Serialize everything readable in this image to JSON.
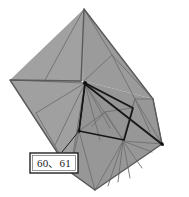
{
  "figure": {
    "kind": "origami folded model with crease lines",
    "canvas": {
      "width": 189,
      "height": 197
    },
    "colors": {
      "background": "#ffffff",
      "face_fill": "#9b9b9b",
      "face_fill_light": "#a4a4a4",
      "face_fill_dark": "#8e8e8e",
      "crease_line": "#6f6f6f",
      "silhouette_outline": "#5a5a5a",
      "highlight_line": "#171717",
      "callout_border": "#222222",
      "callout_fill": "#ffffff",
      "callout_text": "#1a1a1a"
    },
    "silhouette": {
      "name": "outer-boundary",
      "points": "84,9 153,99 162,144 95,190 70,172 10,80 81,81"
    },
    "faces": [
      {
        "name": "upper-left-wing-face",
        "points": "84,9 84,81 81,81 10,80",
        "fill": "#a1a1a1"
      },
      {
        "name": "upper-right-wing-face",
        "points": "84,9 153,99 84,81",
        "fill": "#9b9b9b"
      },
      {
        "name": "left-lower-wing-face",
        "points": "10,80 81,81 85,84 70,172",
        "fill": "#a0a0a0"
      },
      {
        "name": "body-core-face",
        "points": "84,81 153,99 162,144 95,190 70,172",
        "fill": "#979797"
      },
      {
        "name": "inner-pocket-face",
        "points": "85,84 132,108 123,140 79,131",
        "fill": "#949494"
      }
    ],
    "crease_lines": [
      {
        "name": "crease-upper-left-diagonal",
        "points": "84,9 45,80"
      },
      {
        "name": "crease-upper-right-a",
        "points": "84,9 112,55"
      },
      {
        "name": "crease-upper-right-b",
        "points": "112,55 84,81"
      },
      {
        "name": "crease-upper-right-c",
        "points": "112,55 153,99"
      },
      {
        "name": "crease-upper-right-d",
        "points": "112,55 135,99"
      },
      {
        "name": "crease-apex-to-left-tip",
        "points": "85,83 10,80"
      },
      {
        "name": "crease-left-wing-fan-1",
        "points": "85,83 36,113"
      },
      {
        "name": "crease-left-wing-fan-2",
        "points": "85,83 70,172"
      },
      {
        "name": "crease-left-wing-fan-3",
        "points": "85,83 55,145"
      },
      {
        "name": "crease-left-mid-chord",
        "points": "36,113 70,172"
      },
      {
        "name": "crease-apex-fan-a",
        "points": "85,84 132,108"
      },
      {
        "name": "crease-apex-fan-b",
        "points": "85,84 123,140"
      },
      {
        "name": "crease-apex-fan-c",
        "points": "85,84 110,128"
      },
      {
        "name": "crease-apex-fan-d",
        "points": "85,84 100,140"
      },
      {
        "name": "crease-right-node-fan-1",
        "points": "135,99 153,99"
      },
      {
        "name": "crease-right-node-fan-2",
        "points": "135,99 162,144"
      },
      {
        "name": "crease-right-node-fan-3",
        "points": "135,99 150,132"
      },
      {
        "name": "crease-right-node-fan-4",
        "points": "135,99 123,140"
      },
      {
        "name": "crease-right-node-fan-5",
        "points": "135,99 132,108"
      },
      {
        "name": "crease-right-edge-chord",
        "points": "153,99 162,144"
      },
      {
        "name": "crease-bottom-node-fan-1",
        "points": "123,141 95,190"
      },
      {
        "name": "crease-bottom-node-fan-2",
        "points": "123,141 108,186"
      },
      {
        "name": "crease-bottom-node-fan-3",
        "points": "123,141 118,182"
      },
      {
        "name": "crease-bottom-node-fan-4",
        "points": "123,141 130,178"
      },
      {
        "name": "crease-bottom-node-fan-5",
        "points": "123,141 142,168"
      },
      {
        "name": "crease-bottom-node-fan-6",
        "points": "123,141 152,152"
      },
      {
        "name": "crease-bottom-node-fan-7",
        "points": "123,141 162,144"
      },
      {
        "name": "crease-bottom-left-chord",
        "points": "70,172 95,190"
      },
      {
        "name": "crease-pocket-inner-1",
        "points": "105,112 132,108"
      },
      {
        "name": "crease-pocket-inner-2",
        "points": "105,112 123,140"
      },
      {
        "name": "crease-pocket-inner-3",
        "points": "105,112 92,126"
      },
      {
        "name": "crease-pocket-inner-4",
        "points": "105,112 79,131"
      },
      {
        "name": "crease-lower-left-fan-1",
        "points": "79,131 95,190"
      },
      {
        "name": "crease-lower-left-fan-2",
        "points": "79,131 70,172"
      }
    ],
    "highlight_lines": [
      {
        "name": "highlight-apex-to-right-node",
        "points": "85,83 133,108"
      },
      {
        "name": "highlight-right-node-down",
        "points": "133,108 124,140"
      },
      {
        "name": "highlight-pocket-bottom",
        "points": "124,140 79,131"
      },
      {
        "name": "highlight-pocket-left",
        "points": "79,131 85,84"
      },
      {
        "name": "highlight-leader-anchor-run",
        "points": "85,83 79,131"
      },
      {
        "name": "highlight-apex-to-bottom-right",
        "points": "85,84 163,145"
      }
    ],
    "marked_vertices": [
      {
        "name": "vertex-apex",
        "cx": 85,
        "cy": 83
      },
      {
        "name": "vertex-leader-anchor",
        "cx": 79,
        "cy": 131
      },
      {
        "name": "vertex-bottom-right",
        "cx": 162,
        "cy": 144
      }
    ],
    "leader": {
      "name": "callout-leader-line",
      "points": "79,131 62,152"
    },
    "callout": {
      "name": "part-number-callout",
      "label": "60、61",
      "box": {
        "x": 30,
        "y": 153,
        "width": 48,
        "height": 20
      }
    }
  }
}
